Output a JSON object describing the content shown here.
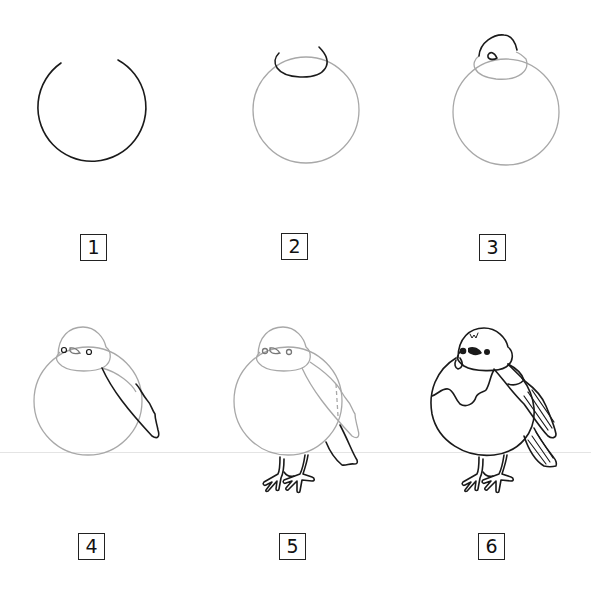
{
  "steps": [
    {
      "number": "1",
      "description": "Open circle with gap at top"
    },
    {
      "number": "2",
      "description": "Body circle with head arc on top"
    },
    {
      "number": "3",
      "description": "Head shape with beak"
    },
    {
      "number": "4",
      "description": "Eyes and wing outline"
    },
    {
      "number": "5",
      "description": "Legs, feet and tail"
    },
    {
      "number": "6",
      "description": "Final inked bird with feather details"
    }
  ],
  "colors": {
    "ink": "#1a1a1a",
    "guide": "#a8a8a8",
    "background": "#ffffff",
    "divider": "#e4e4e4"
  }
}
